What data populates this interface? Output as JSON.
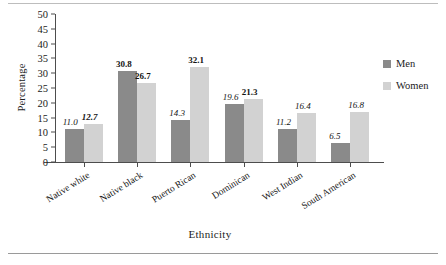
{
  "chart_data": {
    "type": "bar",
    "title": "",
    "xlabel": "Ethnicity",
    "ylabel": "Percentage",
    "ylim": [
      0,
      50
    ],
    "yticks": [
      0,
      5,
      10,
      15,
      20,
      25,
      30,
      35,
      40,
      45,
      50
    ],
    "grid": false,
    "legend_position": "right",
    "categories": [
      "Native white",
      "Native black",
      "Puerto Rican",
      "Dominican",
      "West Indian",
      "South American"
    ],
    "series": [
      {
        "name": "Men",
        "color": "#8a8a8a",
        "values": [
          11.0,
          30.8,
          14.3,
          19.6,
          11.2,
          6.5
        ],
        "labels": [
          "11.0",
          "30.8",
          "14.3",
          "19.6",
          "11.2",
          "6.5"
        ],
        "label_styles": [
          "italic",
          "bold",
          "italic",
          "italic",
          "italic",
          "italic"
        ]
      },
      {
        "name": "Women",
        "color": "#d2d2d2",
        "values": [
          12.7,
          26.7,
          32.1,
          21.3,
          16.4,
          16.8
        ],
        "labels": [
          "12.7",
          "26.7",
          "32.1",
          "21.3",
          "16.4",
          "16.8"
        ],
        "label_styles": [
          "bolditalic",
          "bold",
          "bold",
          "bold",
          "italic",
          "italic"
        ]
      }
    ]
  },
  "legend": {
    "items": [
      {
        "label": "Men",
        "color": "#8a8a8a"
      },
      {
        "label": "Women",
        "color": "#d2d2d2"
      }
    ]
  },
  "axes": {
    "y_title": "Percentage",
    "x_title": "Ethnicity"
  }
}
